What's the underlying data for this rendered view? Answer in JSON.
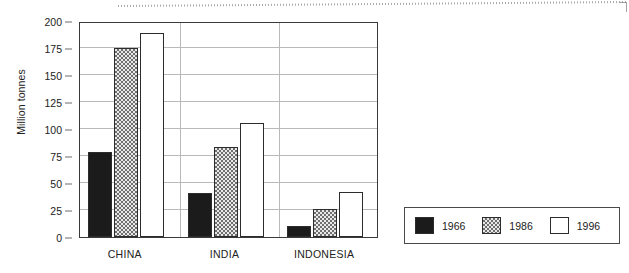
{
  "chart_data": {
    "type": "bar",
    "title": "",
    "subtitle": "",
    "xlabel": "",
    "ylabel": "Million tonnes",
    "categories": [
      "CHINA",
      "INDIA",
      "INDONESIA"
    ],
    "series": [
      {
        "name": "1966",
        "color": "#1b1b1b",
        "pattern": "solid-black",
        "values": [
          79,
          41,
          10
        ]
      },
      {
        "name": "1986",
        "color": "#cfcfcf",
        "pattern": "checkered-gray",
        "values": [
          175,
          83,
          26
        ]
      },
      {
        "name": "1996",
        "color": "#ffffff",
        "pattern": "white",
        "values": [
          189,
          106,
          42
        ]
      }
    ],
    "ylim": [
      0,
      200
    ],
    "ytick_step": 25,
    "yticks": [
      0,
      25,
      50,
      75,
      100,
      125,
      150,
      175,
      200
    ],
    "ytick_labels": [
      "0",
      "25",
      "50",
      "75",
      "100",
      "125",
      "150",
      "175",
      "200"
    ],
    "grid": true,
    "grid_axis": "y",
    "legend_position": "outside-right-bottom",
    "legend_entries": [
      "1966",
      "1986",
      "1996"
    ],
    "units": "Million tonnes"
  },
  "axis": {
    "y_label": "Million tonnes"
  },
  "legend": {
    "items": [
      {
        "label": "1966"
      },
      {
        "label": "1986"
      },
      {
        "label": "1996"
      }
    ]
  }
}
